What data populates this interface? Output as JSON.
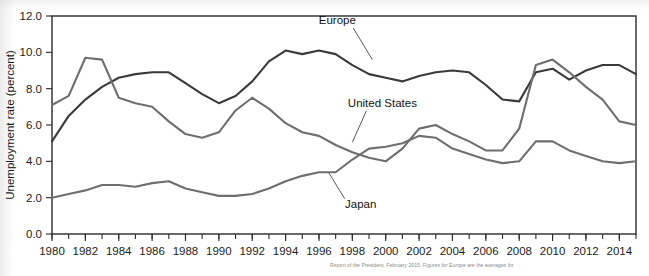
{
  "figure": {
    "ylabel": "Unemployment rate (percent)",
    "source_note": "Report of the President, February 2015. Figures for Europe are the averages for"
  },
  "chart_data": {
    "type": "line",
    "title": "",
    "xlabel": "",
    "ylabel": "Unemployment rate (percent)",
    "xlim": [
      1980,
      2015
    ],
    "ylim": [
      0.0,
      12.0
    ],
    "ytick_labels": [
      "0.0",
      "2.0",
      "4.0",
      "6.0",
      "8.0",
      "10.0",
      "12.0"
    ],
    "ytick_values": [
      0.0,
      2.0,
      4.0,
      6.0,
      8.0,
      10.0,
      12.0
    ],
    "xtick_labels": [
      "1980",
      "1982",
      "1984",
      "1986",
      "1988",
      "1990",
      "1992",
      "1994",
      "1996",
      "1998",
      "2000",
      "2002",
      "2004",
      "2006",
      "2008",
      "2010",
      "2012",
      "2014"
    ],
    "xtick_values": [
      1980,
      1982,
      1984,
      1986,
      1988,
      1990,
      1992,
      1994,
      1996,
      1998,
      2000,
      2002,
      2004,
      2006,
      2008,
      2010,
      2012,
      2014
    ],
    "minor_xticks_every": 1,
    "grid": false,
    "legend": "inline-annotations",
    "x": [
      1980,
      1981,
      1982,
      1983,
      1984,
      1985,
      1986,
      1987,
      1988,
      1989,
      1990,
      1991,
      1992,
      1993,
      1994,
      1995,
      1996,
      1997,
      1998,
      1999,
      2000,
      2001,
      2002,
      2003,
      2004,
      2005,
      2006,
      2007,
      2008,
      2009,
      2010,
      2011,
      2012,
      2013,
      2014,
      2015
    ],
    "series": [
      {
        "name": "Europe",
        "color": "#3a3a3a",
        "linewidth": 2.1,
        "values": [
          5.1,
          6.5,
          7.4,
          8.1,
          8.6,
          8.8,
          8.9,
          8.9,
          8.3,
          7.7,
          7.2,
          7.6,
          8.4,
          9.5,
          10.1,
          9.9,
          10.1,
          9.9,
          9.3,
          8.8,
          8.6,
          8.4,
          8.7,
          8.9,
          9.0,
          8.9,
          8.2,
          7.4,
          7.3,
          8.9,
          9.1,
          8.5,
          9.0,
          9.3,
          9.3,
          8.8
        ]
      },
      {
        "name": "United States",
        "color": "#6e6e6e",
        "linewidth": 2.1,
        "values": [
          7.1,
          7.6,
          9.7,
          9.6,
          7.5,
          7.2,
          7.0,
          6.2,
          5.5,
          5.3,
          5.6,
          6.8,
          7.5,
          6.9,
          6.1,
          5.6,
          5.4,
          4.9,
          4.5,
          4.2,
          4.0,
          4.7,
          5.8,
          6.0,
          5.5,
          5.1,
          4.6,
          4.6,
          5.8,
          9.3,
          9.6,
          8.9,
          8.1,
          7.4,
          6.2,
          6.0
        ]
      },
      {
        "name": "Japan",
        "color": "#6e6e6e",
        "linewidth": 2.1,
        "values": [
          2.0,
          2.2,
          2.4,
          2.7,
          2.7,
          2.6,
          2.8,
          2.9,
          2.5,
          2.3,
          2.1,
          2.1,
          2.2,
          2.5,
          2.9,
          3.2,
          3.4,
          3.4,
          4.1,
          4.7,
          4.8,
          5.0,
          5.4,
          5.3,
          4.7,
          4.4,
          4.1,
          3.9,
          4.0,
          5.1,
          5.1,
          4.6,
          4.3,
          4.0,
          3.9,
          4.0
        ]
      }
    ],
    "annotations": [
      {
        "text": "Europe",
        "series": "Europe",
        "label_x": 1997.1,
        "label_y": 11.55,
        "point_x": 1999.2,
        "point_y": 9.6
      },
      {
        "text": "United States",
        "series": "United States",
        "label_x": 1999.8,
        "label_y": 7.0,
        "point_x": 1998.0,
        "point_y": 5.05
      },
      {
        "text": "Japan",
        "series": "Japan",
        "label_x": 1998.5,
        "label_y": 1.45,
        "point_x": 1996.6,
        "point_y": 3.35
      }
    ]
  }
}
